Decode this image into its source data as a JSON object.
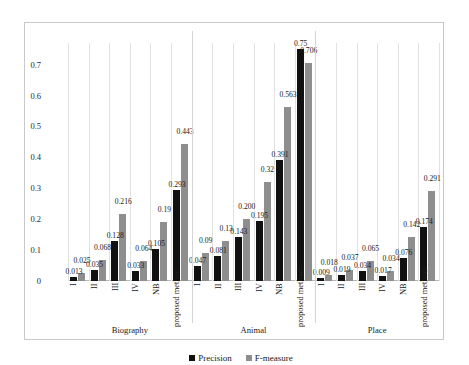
{
  "chart_data": {
    "type": "bar",
    "title": "",
    "xlabel": "",
    "ylabel": "",
    "ylim": [
      0,
      0.75
    ],
    "yticks": [
      "0",
      "0.1",
      "0.2",
      "0.3",
      "0.4",
      "0.5",
      "0.6",
      "0.7"
    ],
    "ytick_values": [
      0,
      0.1,
      0.2,
      0.3,
      0.4,
      0.5,
      0.6,
      0.7
    ],
    "grid": true,
    "legend_position": "bottom",
    "legend": [
      "Precision",
      "F-measure"
    ],
    "series": [
      {
        "name": "Precision",
        "color": "#111111",
        "values": [
          0.013,
          0.035,
          0.128,
          0.033,
          0.105,
          0.293,
          0.047,
          0.081,
          0.143,
          0.195,
          0.391,
          0.75,
          0.009,
          0.019,
          0.034,
          0.017,
          0.076,
          0.174
        ]
      },
      {
        "name": "F-measure",
        "color": "#8e8e8e",
        "values": [
          0.025,
          0.068,
          0.216,
          0.064,
          0.19,
          0.443,
          0.09,
          0.13,
          0.2,
          0.32,
          0.563,
          0.706,
          0.018,
          0.037,
          0.065,
          0.034,
          0.142,
          0.291
        ]
      }
    ],
    "groups": [
      {
        "label": "Biography",
        "categories": [
          "I",
          "II",
          "III",
          "IV",
          "NB",
          "proposed method"
        ],
        "precision": [
          "0.013",
          "0.035",
          "0.128",
          "0.033",
          "0.105",
          "0.293"
        ],
        "fmeasure": [
          "0.025",
          "0.068",
          "0.216",
          "0.064",
          "0.19",
          "0.443"
        ]
      },
      {
        "label": "Animal",
        "categories": [
          "I",
          "II",
          "III",
          "IV",
          "NB",
          "proposed method"
        ],
        "precision": [
          "0.047",
          "0.081",
          "0.143",
          "0.195",
          "0.391",
          "0.75"
        ],
        "fmeasure": [
          "0.09",
          "0.13",
          "0.200",
          "0.32",
          "0.563",
          "0.706"
        ]
      },
      {
        "label": "Place",
        "categories": [
          "I",
          "II",
          "III",
          "IV",
          "NB",
          "proposed method"
        ],
        "precision": [
          "0.009",
          "0.019",
          "0.034",
          "0.017",
          "0.076",
          "0.174"
        ],
        "fmeasure": [
          "0.018",
          "0.037",
          "0.065",
          "0.034",
          "0.142",
          "0.291"
        ]
      }
    ]
  }
}
